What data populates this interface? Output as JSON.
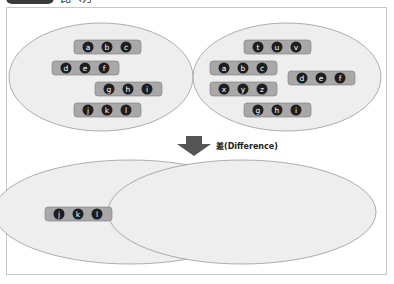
{
  "header": {
    "label_text": "比べ方"
  },
  "top_sets": {
    "left": {
      "groups": [
        [
          "a",
          "b",
          "c"
        ],
        [
          "d",
          "e",
          "f"
        ],
        [
          "g",
          "h",
          "i"
        ],
        [
          "j",
          "k",
          "l"
        ]
      ]
    },
    "right": {
      "groups": [
        [
          "t",
          "u",
          "v"
        ],
        [
          "a",
          "b",
          "c"
        ],
        [
          "d",
          "e",
          "f"
        ],
        [
          "x",
          "y",
          "z"
        ],
        [
          "g",
          "h",
          "i"
        ]
      ]
    }
  },
  "operation": {
    "label": "差(Difference)",
    "icon": "down-arrow-icon"
  },
  "result": {
    "groups": [
      [
        "j",
        "k",
        "l"
      ]
    ]
  },
  "colors": {
    "ellipse_fill": "#eeeeee",
    "ellipse_stroke": "#9a9a9a",
    "chip_fill": "#a8a8a8",
    "chip_stroke": "#7a7a7a",
    "dot_fill": "#1e1e1e",
    "arrow": "#555555"
  }
}
